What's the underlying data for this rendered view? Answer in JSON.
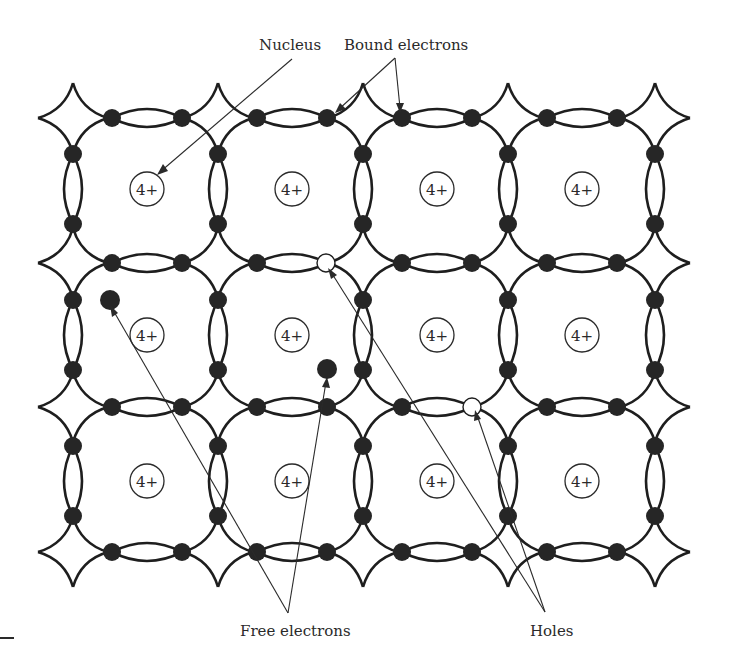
{
  "figure": {
    "labels": {
      "nucleus": "Nucleus",
      "bound_electrons": "Bound electrons",
      "free_electrons": "Free electrons",
      "holes": "Holes"
    },
    "nucleus_charge": "4+",
    "lattice": {
      "columns": 4,
      "rows": 3,
      "cell_centers_x": [
        147,
        292,
        437,
        582
      ],
      "cell_centers_y": [
        189,
        335,
        481
      ],
      "bond_rows_y": [
        118,
        263,
        407,
        552
      ],
      "bond_cols_x": [
        73,
        218,
        363,
        508,
        655
      ]
    },
    "free_electrons": [
      {
        "x": 110,
        "y": 300
      },
      {
        "x": 327,
        "y": 369
      }
    ],
    "holes": [
      {
        "x": 326,
        "y": 263
      },
      {
        "x": 472,
        "y": 407
      }
    ],
    "colors": {
      "ink": "#1e1e1e",
      "background": "#ffffff"
    }
  }
}
